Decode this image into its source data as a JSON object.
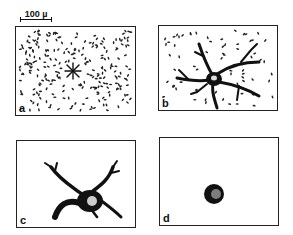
{
  "figure": {
    "scale_bar": {
      "label": "100 µ"
    },
    "panels": [
      {
        "id": "a",
        "label": "a",
        "description": "dense field of scattered small cells with a central star-shaped cluster"
      },
      {
        "id": "b",
        "label": "b",
        "description": "central cell body with long branching processes amid scattered cells"
      },
      {
        "id": "c",
        "label": "c",
        "description": "cell body with few thick retracting processes"
      },
      {
        "id": "d",
        "label": "d",
        "description": "single rounded cell body, no processes"
      }
    ]
  }
}
